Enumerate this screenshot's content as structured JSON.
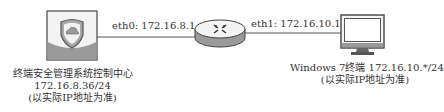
{
  "diagram": {
    "nodes": [
      {
        "id": "server",
        "type": "management-server",
        "icon": "shield-cloud-icon",
        "label_lines": [
          "终端安全管理系统控制中心",
          "172.16.8.36/24",
          "(以实际IP地址为准)"
        ]
      },
      {
        "id": "router",
        "type": "router",
        "icon": "router-icon"
      },
      {
        "id": "client",
        "type": "terminal",
        "icon": "monitor-icon",
        "label_lines": [
          "Windows 7终端 172.16.10.*/24",
          "(以实际IP地址为准)"
        ]
      }
    ],
    "links": [
      {
        "from": "server",
        "to": "router",
        "label": "eth0: 172.16.8.1"
      },
      {
        "from": "router",
        "to": "client",
        "label": "eth1: 172.16.10.1"
      }
    ],
    "colors": {
      "line": "#555555",
      "icon_fill": "#9a9a9a",
      "icon_light": "#f2f2f2",
      "outline": "#444444"
    }
  }
}
